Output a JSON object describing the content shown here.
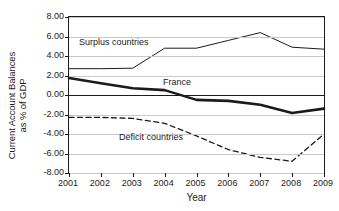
{
  "chart_data": {
    "type": "line",
    "title": "",
    "xlabel": "Year",
    "ylabel": "Current Account Balances\nas % of GDP",
    "categories": [
      "2001",
      "2002",
      "2003",
      "2004",
      "2005",
      "2006",
      "2007",
      "2008",
      "2009"
    ],
    "x": [
      2001,
      2002,
      2003,
      2004,
      2005,
      2006,
      2007,
      2008,
      2009
    ],
    "ylim": [
      -8.0,
      8.0
    ],
    "ytick_values": [
      8.0,
      6.0,
      4.0,
      2.0,
      0.0,
      -2.0,
      -4.0,
      -6.0,
      -8.0
    ],
    "ytick_labels": [
      "8.00",
      "6.00",
      "4.00",
      "2.00",
      "0.00",
      "-2.00",
      "-4.00",
      "-6.00",
      "-8.00"
    ],
    "grid": true,
    "legend": "inline-annotations",
    "series": [
      {
        "name": "Surplus countries",
        "style": "solid-thin",
        "color": "#1b1b1b",
        "values": [
          2.7,
          2.7,
          2.75,
          4.8,
          4.8,
          5.6,
          6.4,
          4.9,
          4.7
        ]
      },
      {
        "name": "France",
        "style": "solid-thick",
        "color": "#1b1b1b",
        "values": [
          1.75,
          1.2,
          0.7,
          0.5,
          -0.5,
          -0.6,
          -1.0,
          -1.85,
          -1.4
        ]
      },
      {
        "name": "Deficit countries",
        "style": "dashed",
        "color": "#1b1b1b",
        "values": [
          -2.3,
          -2.3,
          -2.4,
          -2.9,
          -4.2,
          -5.6,
          -6.4,
          -6.8,
          -4.0
        ]
      }
    ],
    "annotations": [
      {
        "text": "Surplus countries",
        "x_px": 79,
        "y_px": 37
      },
      {
        "text": "France",
        "x_px": 163,
        "y_px": 77
      },
      {
        "text": "Deficit countries",
        "x_px": 119,
        "y_px": 132
      }
    ]
  }
}
